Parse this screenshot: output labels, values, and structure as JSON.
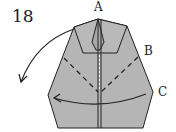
{
  "step_number": "18",
  "labels": {
    "a": "A",
    "b": "B",
    "c": "C"
  },
  "colors": {
    "paper": "#b5b5b5",
    "line": "#222222",
    "background": "#ffffff"
  }
}
